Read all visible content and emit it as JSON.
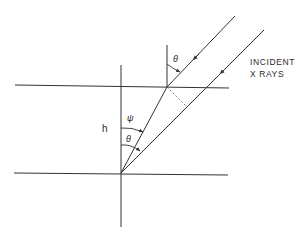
{
  "diagram": {
    "caption_line1": "INCIDENT",
    "caption_line2": "X RAYS",
    "labels": {
      "theta_top": "θ",
      "psi": "ψ",
      "theta_bottom": "θ",
      "height": "h"
    },
    "colors": {
      "line": "#333333",
      "background": "#ffffff"
    }
  }
}
